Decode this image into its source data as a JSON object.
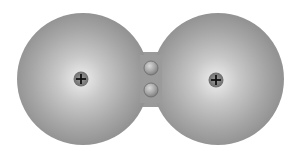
{
  "diagram": {
    "type": "covalent-bond-molecule",
    "background": "#ffffff",
    "cloud_color_edge": "#959595",
    "cloud_color_center": "#e4e4e4",
    "atoms": [
      {
        "name": "left-atom",
        "cx": 83,
        "cy": 79,
        "r": 66,
        "nucleus": {
          "cx": 81,
          "cy": 79,
          "r": 7.5,
          "symbol": "+"
        }
      },
      {
        "name": "right-atom",
        "cx": 218,
        "cy": 79,
        "r": 66,
        "nucleus": {
          "cx": 216,
          "cy": 80,
          "r": 7.5,
          "symbol": "+"
        }
      }
    ],
    "shared_electrons": [
      {
        "cx": 151,
        "cy": 68,
        "r": 7
      },
      {
        "cx": 151,
        "cy": 90,
        "r": 7
      }
    ],
    "nucleus_symbol": "+",
    "nucleus_color": "#8a8a8a",
    "electron_color": "#9c9c9c"
  }
}
